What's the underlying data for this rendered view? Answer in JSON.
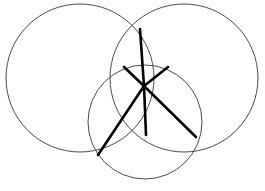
{
  "figure": {
    "type": "geometric-line-drawing",
    "canvas": {
      "width": 265,
      "height": 191,
      "background": "#ffffff"
    },
    "style": {
      "circle_stroke": "#4a4a4a",
      "circle_stroke_width": 1,
      "chord_stroke": "#000000",
      "chord_stroke_width": 2.6
    },
    "circles": [
      {
        "name": "left-circle",
        "cx": 80,
        "cy": 78,
        "r": 74
      },
      {
        "name": "right-circle",
        "cx": 184,
        "cy": 78,
        "r": 74
      },
      {
        "name": "bottom-circle",
        "cx": 145,
        "cy": 122,
        "r": 57
      }
    ],
    "hub": {
      "name": "central-hub",
      "x": 144,
      "y": 86
    },
    "vertices": [
      {
        "name": "vertex-top",
        "x": 140,
        "y": 29
      },
      {
        "name": "vertex-upper-left",
        "x": 124,
        "y": 67
      },
      {
        "name": "vertex-upper-right",
        "x": 168,
        "y": 67
      },
      {
        "name": "vertex-lower-center",
        "x": 146,
        "y": 135
      },
      {
        "name": "vertex-lower-left",
        "x": 98,
        "y": 155
      },
      {
        "name": "vertex-lower-right",
        "x": 196,
        "y": 137
      }
    ],
    "chords": [
      {
        "name": "chord-hub-to-top",
        "x1": 144,
        "y1": 86,
        "x2": 140,
        "y2": 29
      },
      {
        "name": "chord-hub-to-upper-left",
        "x1": 144,
        "y1": 86,
        "x2": 124,
        "y2": 67
      },
      {
        "name": "chord-hub-to-upper-right",
        "x1": 144,
        "y1": 86,
        "x2": 168,
        "y2": 67
      },
      {
        "name": "chord-hub-to-lower-center",
        "x1": 144,
        "y1": 86,
        "x2": 146,
        "y2": 135
      },
      {
        "name": "chord-hub-to-lower-left",
        "x1": 144,
        "y1": 86,
        "x2": 98,
        "y2": 155
      },
      {
        "name": "chord-hub-to-lower-right",
        "x1": 144,
        "y1": 86,
        "x2": 196,
        "y2": 137
      }
    ]
  }
}
